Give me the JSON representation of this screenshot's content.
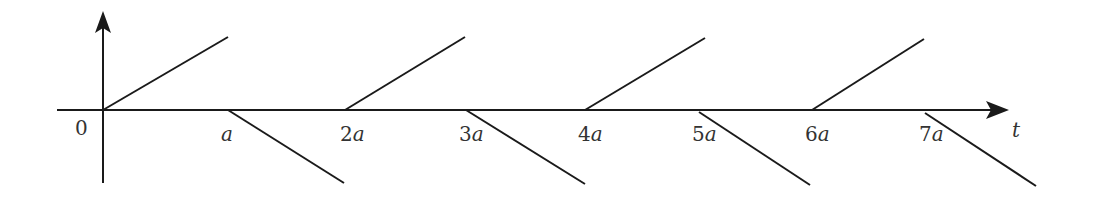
{
  "diagram": {
    "type": "sawtooth-signal",
    "colors": {
      "stroke": "#1a1a1a",
      "text": "#333333",
      "background": "#ffffff"
    },
    "axes": {
      "x_label": "t",
      "y_arrow": true,
      "origin_label": "0"
    },
    "tick_labels": [
      "a",
      "2a",
      "3a",
      "4a",
      "5a",
      "6a",
      "7a"
    ],
    "tick_coefficients": [
      "",
      "2",
      "3",
      "4",
      "5",
      "6",
      "7"
    ],
    "tick_variable": "a",
    "segments": [
      {
        "from_t": "0",
        "direction": "up"
      },
      {
        "from_t": "a",
        "direction": "down"
      },
      {
        "from_t": "2a",
        "direction": "up"
      },
      {
        "from_t": "3a",
        "direction": "down"
      },
      {
        "from_t": "4a",
        "direction": "up"
      },
      {
        "from_t": "5a",
        "direction": "down"
      },
      {
        "from_t": "6a",
        "direction": "up"
      },
      {
        "from_t": "7a",
        "direction": "down"
      }
    ]
  }
}
